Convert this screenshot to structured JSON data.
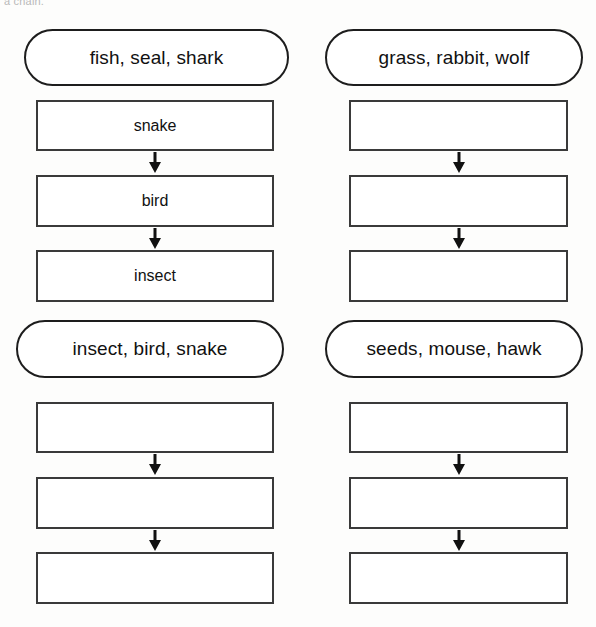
{
  "page": {
    "clipped_top_text": "a chain.",
    "background_color": "#fdfdfc",
    "ink_color": "#1d1d1d"
  },
  "chains": [
    {
      "id": "chain-1",
      "wordbank": "fish, seal, shark",
      "steps": [
        "snake",
        "bird",
        "insect"
      ],
      "arrows": [
        "down-arrow-icon",
        "down-arrow-icon"
      ]
    },
    {
      "id": "chain-2",
      "wordbank": "grass, rabbit, wolf",
      "steps": [
        "",
        "",
        ""
      ],
      "arrows": [
        "down-arrow-icon",
        "down-arrow-icon"
      ]
    },
    {
      "id": "chain-3",
      "wordbank": "insect, bird, snake",
      "steps": [
        "",
        "",
        ""
      ],
      "arrows": [
        "down-arrow-icon",
        "down-arrow-icon"
      ]
    },
    {
      "id": "chain-4",
      "wordbank": "seeds, mouse, hawk",
      "steps": [
        "",
        "",
        ""
      ],
      "arrows": [
        "down-arrow-icon",
        "down-arrow-icon"
      ]
    }
  ]
}
